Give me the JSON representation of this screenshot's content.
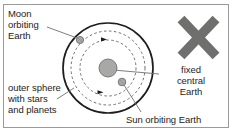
{
  "figure": {
    "name": "geocentric-model-diagram",
    "border_color": "#9a9a99",
    "background": "#ffffff"
  },
  "labels": {
    "moon": "Moon\norbiting\nEarth",
    "outer_sphere": "outer sphere\nwith stars\nand planets",
    "fixed_central_earth": "fixed\ncentral\nEarth",
    "sun_orbiting_earth": "Sun orbiting Earth"
  },
  "diagram": {
    "center": {
      "x": 108,
      "y": 68
    },
    "outer_sphere": {
      "radius": 45,
      "stroke": "#1d1d1b",
      "stroke_width": 1.6,
      "style": "solid"
    },
    "orbits": [
      {
        "name": "moon-orbit",
        "radius": 28,
        "stroke": "#6f6f6e",
        "style": "dashed"
      },
      {
        "name": "sun-orbit",
        "radius": 37,
        "stroke": "#6f6f6e",
        "style": "dashed"
      }
    ],
    "bodies": [
      {
        "name": "earth",
        "label": "Earth",
        "x": 108,
        "y": 68,
        "radius": 9,
        "fill": "#a8a8a7",
        "stroke": "#6f6f6e"
      },
      {
        "name": "moon",
        "label": "Moon",
        "x": 80,
        "y": 40,
        "radius": 3.6,
        "fill": "#a8a8a7",
        "stroke": "#6f6f6e"
      },
      {
        "name": "sun",
        "label": "Sun",
        "x": 122,
        "y": 82,
        "radius": 3.8,
        "fill": "#a8a8a7",
        "stroke": "#6f6f6e"
      }
    ],
    "direction_markers": [
      {
        "name": "moon-orbit-direction-arrow",
        "x": 104,
        "y": 41
      },
      {
        "name": "sun-orbit-direction-arrow",
        "x": 101,
        "y": 92
      }
    ],
    "cross_mark": {
      "name": "cross-mark",
      "color": "#6f6f6e",
      "x1": 180,
      "y1": 19,
      "x2": 216,
      "y2": 56,
      "stroke_width": 9
    },
    "leader_lines": [
      {
        "name": "leader-moon",
        "x1": 47,
        "y1": 27,
        "x2": 77,
        "y2": 38
      },
      {
        "name": "leader-outer",
        "x1": 57,
        "y1": 98,
        "x2": 74,
        "y2": 88
      },
      {
        "name": "leader-fixed",
        "x1": 158,
        "y1": 74,
        "x2": 113,
        "y2": 70
      },
      {
        "name": "leader-sun",
        "x1": 140,
        "y1": 112,
        "x2": 124,
        "y2": 85
      }
    ]
  }
}
